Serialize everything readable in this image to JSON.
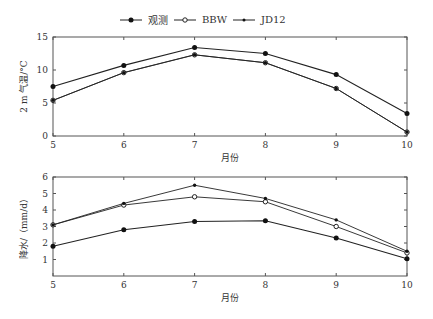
{
  "legend": [
    {
      "name": "观测",
      "marker": "filled-circle"
    },
    {
      "name": "BBW",
      "marker": "open-circle"
    },
    {
      "name": "JD12",
      "marker": "star"
    }
  ],
  "chart_data": [
    {
      "type": "line",
      "title": "",
      "xlabel": "月份",
      "ylabel": "2 m 气温/°C",
      "x": [
        5,
        6,
        7,
        8,
        9,
        10
      ],
      "ylim": [
        0,
        15
      ],
      "yticks": [
        0,
        5,
        10,
        15
      ],
      "grid": false,
      "legend_position": "top-center",
      "series": [
        {
          "name": "观测",
          "values": [
            7.5,
            10.7,
            13.4,
            12.5,
            9.3,
            3.4
          ]
        },
        {
          "name": "BBW",
          "values": [
            5.4,
            9.6,
            12.3,
            11.1,
            7.2,
            0.6
          ]
        },
        {
          "name": "JD12",
          "values": [
            5.4,
            9.6,
            12.3,
            11.1,
            7.2,
            0.6
          ]
        }
      ]
    },
    {
      "type": "line",
      "title": "",
      "xlabel": "月份",
      "ylabel": "降水/（mm/d）",
      "x": [
        5,
        6,
        7,
        8,
        9,
        10
      ],
      "ylim": [
        0,
        6
      ],
      "yticks": [
        1,
        2,
        3,
        4,
        5,
        6
      ],
      "grid": false,
      "series": [
        {
          "name": "观测",
          "values": [
            1.8,
            2.8,
            3.3,
            3.35,
            2.3,
            1.05
          ]
        },
        {
          "name": "BBW",
          "values": [
            3.1,
            4.3,
            4.8,
            4.5,
            3.0,
            1.4
          ]
        },
        {
          "name": "JD12",
          "values": [
            3.1,
            4.4,
            5.5,
            4.7,
            3.4,
            1.5
          ]
        }
      ]
    }
  ]
}
